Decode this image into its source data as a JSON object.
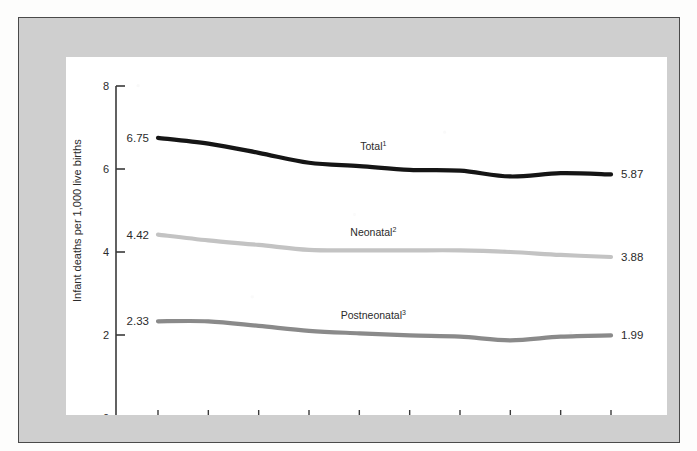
{
  "figure": {
    "background_color": "#cfcfcf",
    "panel_color": "#ffffff",
    "border_color": "#4a4a4a"
  },
  "chart_data": {
    "type": "line",
    "title": "",
    "xlabel": "",
    "ylabel": "Infant deaths per 1,000 live births",
    "x": [
      2007,
      2008,
      2009,
      2010,
      2011,
      2012,
      2013,
      2014,
      2015,
      2016
    ],
    "categories": [
      "2007",
      "2008",
      "2009",
      "2010",
      "2011",
      "2012",
      "2013",
      "2014",
      "2015",
      "2016"
    ],
    "ylim": [
      0,
      8
    ],
    "yticks": [
      0,
      2,
      4,
      6,
      8
    ],
    "ytick_labels": [
      "0",
      "2",
      "4",
      "6",
      "8"
    ],
    "grid": false,
    "legend_position": "inline-labels",
    "series": [
      {
        "name": "Total",
        "footnote_marker": "1",
        "color": "#151515",
        "line_width": 4.2,
        "values": [
          6.75,
          6.61,
          6.39,
          6.15,
          6.07,
          5.98,
          5.96,
          5.82,
          5.9,
          5.87
        ],
        "start_label": "6.75",
        "end_label": "5.87"
      },
      {
        "name": "Neonatal",
        "footnote_marker": "2",
        "color": "#c3c3c3",
        "line_width": 4.2,
        "values": [
          4.42,
          4.28,
          4.17,
          4.05,
          4.04,
          4.04,
          4.04,
          4.0,
          3.93,
          3.88
        ],
        "start_label": "4.42",
        "end_label": "3.88"
      },
      {
        "name": "Postneonatal",
        "footnote_marker": "3",
        "color": "#8a8a8a",
        "line_width": 4.2,
        "values": [
          2.33,
          2.33,
          2.22,
          2.1,
          2.04,
          1.99,
          1.96,
          1.87,
          1.96,
          1.99
        ],
        "start_label": "2.33",
        "end_label": "1.99"
      }
    ]
  }
}
